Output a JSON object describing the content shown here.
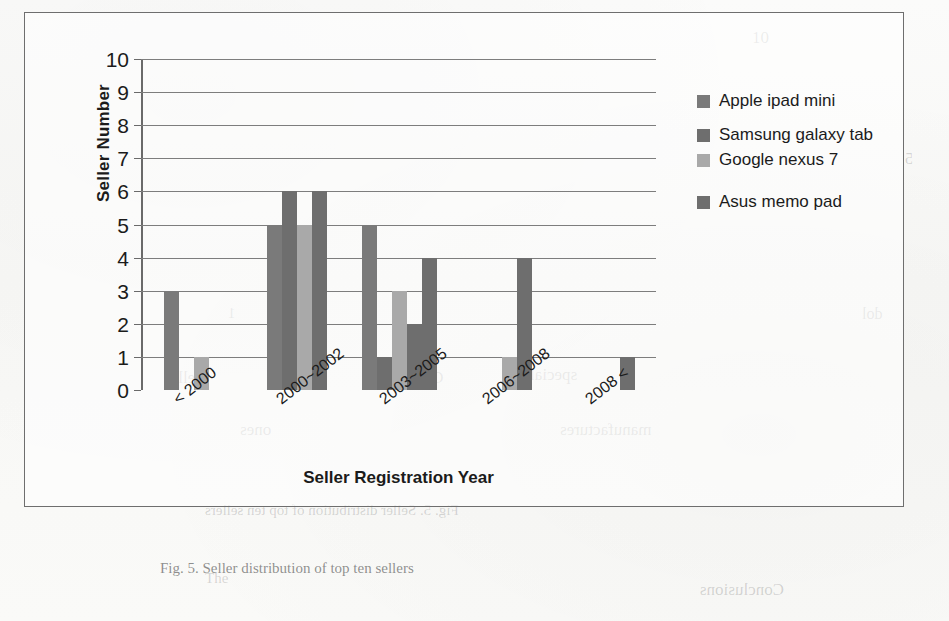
{
  "figure": {
    "frame_visible": true,
    "caption": "Fig. 5. Seller distribution of top ten sellers"
  },
  "legend": {
    "position": "right",
    "items": [
      {
        "label": "Apple ipad mini",
        "color": "#7a7a7a"
      },
      {
        "label": "Samsung galaxy tab",
        "color": "#6e6e6e"
      },
      {
        "label": "Google nexus 7",
        "color": "#a9a9a9"
      },
      {
        "label": "Asus memo pad",
        "color": "#6e6e6e"
      }
    ]
  },
  "axes": {
    "y_title": "Seller Number",
    "x_title": "Seller Registration Year",
    "y_ticks": [
      "10",
      "9",
      "8",
      "7",
      "6",
      "5",
      "4",
      "3",
      "2",
      "1",
      "0"
    ]
  },
  "ghost_text": [
    {
      "text": "10",
      "x": 752,
      "y": 28,
      "size": 17,
      "flip": false
    },
    {
      "text": "5",
      "x": 905,
      "y": 150,
      "size": 16,
      "flip": true
    },
    {
      "text": "1",
      "x": 228,
      "y": 305,
      "size": 15,
      "flip": true
    },
    {
      "text": "dol",
      "x": 862,
      "y": 305,
      "size": 16,
      "flip": true
    },
    {
      "text": "Seller",
      "x": 165,
      "y": 368,
      "size": 17,
      "flip": true
    },
    {
      "text": "C'mera",
      "x": 395,
      "y": 368,
      "size": 17,
      "flip": true
    },
    {
      "text": "special",
      "x": 530,
      "y": 365,
      "size": 17,
      "flip": true
    },
    {
      "text": "ones",
      "x": 240,
      "y": 420,
      "size": 17,
      "flip": true
    },
    {
      "text": "manufactures",
      "x": 560,
      "y": 420,
      "size": 17,
      "flip": true
    },
    {
      "text": "Fig. 5. Seller distribution of top ten sellers",
      "x": 205,
      "y": 502,
      "size": 15,
      "flip": true
    },
    {
      "text": "Conclusions",
      "x": 700,
      "y": 580,
      "size": 17,
      "flip": true
    },
    {
      "text": "The",
      "x": 205,
      "y": 570,
      "size": 15,
      "flip": false
    }
  ],
  "chart_data": {
    "type": "bar",
    "title": "",
    "xlabel": "Seller Registration Year",
    "ylabel": "Seller Number",
    "ylim": [
      0,
      10
    ],
    "ytick_step": 1,
    "grid": true,
    "legend_position": "right",
    "categories": [
      "< 2000",
      "2000~2002",
      "2003~2005",
      "2006~2008",
      "2008 <"
    ],
    "series": [
      {
        "name": "Apple ipad mini",
        "color": "#7a7a7a",
        "values": [
          3,
          5,
          5,
          0,
          0
        ]
      },
      {
        "name": "Samsung galaxy tab",
        "color": "#6e6e6e",
        "values": [
          0,
          6,
          1,
          0,
          0
        ]
      },
      {
        "name": "Google nexus 7",
        "color": "#a9a9a9",
        "values": [
          1,
          5,
          3,
          1,
          0
        ]
      },
      {
        "name": "Asus memo pad",
        "color": "#6e6e6e",
        "values": [
          0,
          6,
          2,
          4,
          1
        ]
      }
    ],
    "extra_bars": [
      {
        "category": "2003~2005",
        "value": 4,
        "color": "#6e6e6e"
      }
    ]
  }
}
